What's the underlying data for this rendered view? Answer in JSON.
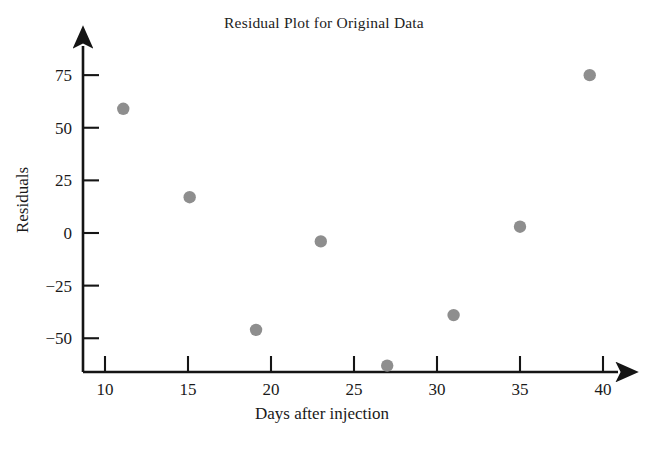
{
  "chart_data": {
    "type": "scatter",
    "title": "Residual Plot for Original Data",
    "xlabel": "Days after injection",
    "ylabel": "Residuals",
    "xlim": [
      8.7,
      42.5
    ],
    "ylim": [
      -72,
      88
    ],
    "grid": false,
    "legend": null,
    "point_color": "#8e8e8e",
    "axis_color": "#151515",
    "x": [
      11.1,
      15.1,
      19.1,
      23.0,
      27.0,
      31.0,
      35.0,
      39.2
    ],
    "y": [
      59,
      17,
      -46,
      -4,
      -63,
      -39,
      3,
      75
    ],
    "points": [
      {
        "x": 11.1,
        "y": 59
      },
      {
        "x": 15.1,
        "y": 17
      },
      {
        "x": 19.1,
        "y": -46
      },
      {
        "x": 23.0,
        "y": -4
      },
      {
        "x": 27.0,
        "y": -63
      },
      {
        "x": 31.0,
        "y": -39
      },
      {
        "x": 35.0,
        "y": 3
      },
      {
        "x": 39.2,
        "y": 75
      }
    ],
    "xticks": [
      10,
      15,
      20,
      25,
      30,
      35,
      40
    ],
    "xticklabels": [
      "10",
      "15",
      "20",
      "25",
      "30",
      "35",
      "40"
    ],
    "yticks": [
      -50,
      -25,
      0,
      25,
      50,
      75
    ],
    "yticklabels": [
      "−50",
      "−25",
      "0",
      "25",
      "50",
      "75"
    ]
  },
  "figure": {
    "title": "Residual Plot for Original Data",
    "x_axis_label": "Days after injection",
    "y_axis_label": "Residuals"
  }
}
